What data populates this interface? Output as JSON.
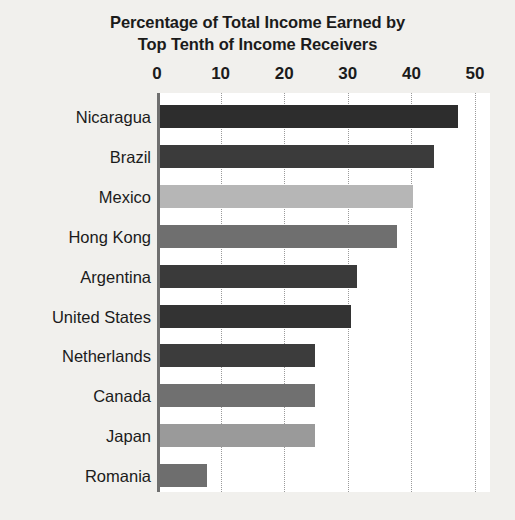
{
  "chart_data": {
    "type": "bar",
    "orientation": "horizontal",
    "title": "Percentage of Total Income Earned by Top Tenth of Income Receivers",
    "title_lines": [
      "Percentage of Total Income Earned by",
      "Top Tenth of Income Receivers"
    ],
    "xlabel": "",
    "ylabel": "",
    "xlim": [
      0,
      50
    ],
    "xticks": [
      0,
      10,
      20,
      30,
      40,
      50
    ],
    "xtick_labels": [
      "0",
      "10",
      "20",
      "30",
      "40",
      "50"
    ],
    "grid": true,
    "grid_axis": "x",
    "grid_style": "dotted",
    "legend": false,
    "axis_position": "top",
    "categories": [
      "Nicaragua",
      "Brazil",
      "Mexico",
      "Hong Kong",
      "Argentina",
      "United States",
      "Netherlands",
      "Canada",
      "Japan",
      "Romania"
    ],
    "values": [
      47.3,
      43.6,
      40.2,
      37.7,
      31.4,
      30.5,
      24.8,
      24.8,
      24.8,
      7.9
    ],
    "bar_colors": [
      "#2d2d2d",
      "#3b3b3b",
      "#b6b6b6",
      "#6f6f6f",
      "#3a3a3a",
      "#333333",
      "#3c3c3c",
      "#707070",
      "#9a9a9a",
      "#6e6e6e"
    ]
  },
  "style": {
    "page_background": "#f1f0ed",
    "plot_background": "#ffffff",
    "text_color": "#1b1b1b",
    "gridline_color": "#9a9a9a",
    "axis_color": "#6f6f6f"
  }
}
